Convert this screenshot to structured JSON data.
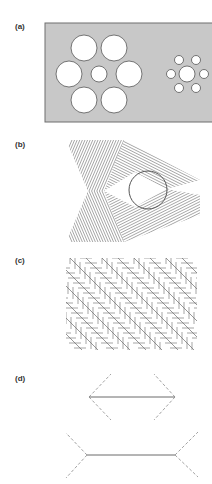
{
  "figure": {
    "panels": [
      {
        "id": "a",
        "label": "(a)",
        "name": "Ebbinghaus illusion"
      },
      {
        "id": "b",
        "label": "(b)",
        "name": "Line-texture triangle with circle"
      },
      {
        "id": "c",
        "label": "(c)",
        "name": "Zöllner illusion"
      },
      {
        "id": "d",
        "label": "(d)",
        "name": "Müller-Lyer illusion"
      }
    ]
  },
  "colors": {
    "background": "#ffffff",
    "panel_a_fill": "#c8c8c8",
    "panel_a_border": "#6e6e6e",
    "circle_fill": "#ffffff",
    "circle_stroke": "#555555",
    "line": "#6a6a6a",
    "dashed": "#8a8a8a",
    "label": "#333333"
  },
  "panel_a": {
    "rect": {
      "x": 45,
      "y": 23,
      "w": 170,
      "h": 99
    },
    "left_cluster": {
      "center": {
        "cx": 99,
        "cy": 74,
        "r": 8
      },
      "surround": [
        {
          "cx": 84,
          "cy": 48,
          "r": 13
        },
        {
          "cx": 114,
          "cy": 48,
          "r": 13
        },
        {
          "cx": 69,
          "cy": 74,
          "r": 13
        },
        {
          "cx": 129,
          "cy": 74,
          "r": 13
        },
        {
          "cx": 84,
          "cy": 100,
          "r": 13
        },
        {
          "cx": 114,
          "cy": 100,
          "r": 13
        }
      ]
    },
    "right_cluster": {
      "center": {
        "cx": 187,
        "cy": 74,
        "r": 8
      },
      "surround": [
        {
          "cx": 179,
          "cy": 60,
          "r": 4.5
        },
        {
          "cx": 196,
          "cy": 60,
          "r": 4.5
        },
        {
          "cx": 171,
          "cy": 74,
          "r": 4.5
        },
        {
          "cx": 204,
          "cy": 74,
          "r": 4.5
        },
        {
          "cx": 179,
          "cy": 88,
          "r": 4.5
        },
        {
          "cx": 196,
          "cy": 88,
          "r": 4.5
        }
      ]
    }
  },
  "panel_b": {
    "circle": {
      "cx": 148,
      "cy": 190,
      "r": 19
    },
    "triangle": [
      [
        135,
        172
      ],
      [
        135,
        207
      ],
      [
        166,
        189
      ]
    ]
  },
  "panel_c": {
    "bounds": {
      "x": 66,
      "y": 258,
      "w": 131,
      "h": 92
    }
  },
  "panel_d": {
    "top": {
      "x1": 89,
      "x2": 175,
      "y": 397,
      "wing_dx": 22,
      "wing_dy": 23,
      "direction": "inward"
    },
    "bottom": {
      "x1": 87,
      "x2": 175,
      "y": 455,
      "wing_dx": -22,
      "wing_dy": 22,
      "direction": "outward"
    }
  }
}
